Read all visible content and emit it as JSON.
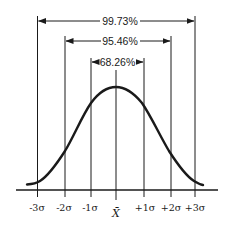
{
  "figure": {
    "ranges": [
      {
        "label": "99.73%",
        "from": "-3σ",
        "to": "+3σ"
      },
      {
        "label": "95.46%",
        "from": "-2σ",
        "to": "+2σ"
      },
      {
        "label": "68.26%",
        "from": "-1σ",
        "to": "+1σ"
      }
    ],
    "axis_labels": [
      "-3σ",
      "-2σ",
      "-1σ",
      "X̄",
      "+1σ",
      "+2σ",
      "+3σ"
    ],
    "mean_label": "X̄",
    "colors": {
      "ink": "#1a1a1a",
      "background": "#ffffff"
    }
  }
}
